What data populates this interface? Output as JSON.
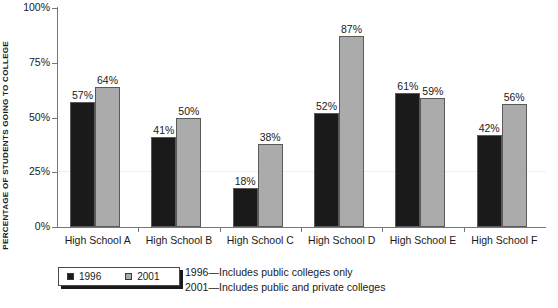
{
  "chart_data": {
    "type": "bar",
    "title": "",
    "xlabel": "",
    "ylabel": "PERCENTAGE OF STUDENTS GOING TO COLLEGE",
    "ylim": [
      0,
      100
    ],
    "yticks": [
      "0%",
      "25%",
      "50%",
      "75%",
      "100%"
    ],
    "ytick_values": [
      0,
      25,
      50,
      75,
      100
    ],
    "grid": false,
    "legend_position": "bottom-left",
    "categories": [
      "High School A",
      "High School B",
      "High School C",
      "High School D",
      "High School E",
      "High School F"
    ],
    "series": [
      {
        "name": "1996",
        "color": "#1a1a1a",
        "values": [
          57,
          41,
          18,
          52,
          61,
          42
        ],
        "labels": [
          "57%",
          "41%",
          "18%",
          "52%",
          "61%",
          "42%"
        ]
      },
      {
        "name": "2001",
        "color": "#ababab",
        "values": [
          64,
          50,
          38,
          87,
          59,
          56
        ],
        "labels": [
          "64%",
          "50%",
          "38%",
          "87%",
          "59%",
          "56%"
        ]
      }
    ],
    "annotations": [
      "1996—Includes public colleges only",
      "2001—Includes public and private colleges"
    ]
  },
  "legend": {
    "items": [
      {
        "label": "1996",
        "swatch": "dark-square-icon"
      },
      {
        "label": "2001",
        "swatch": "gray-square-icon"
      }
    ]
  },
  "notes": {
    "line1": "1996—Includes public colleges only",
    "line2": "2001—Includes public and private colleges"
  }
}
